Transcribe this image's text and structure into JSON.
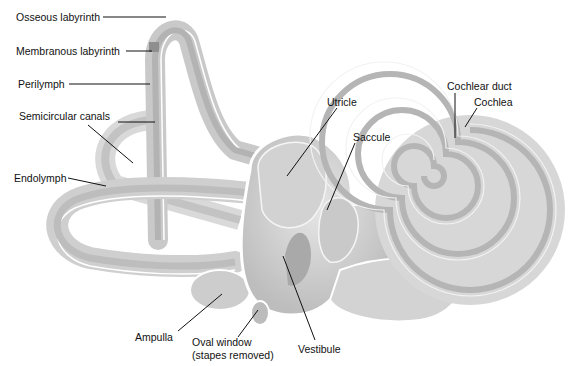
{
  "diagram": {
    "labels": [
      {
        "id": "osseous",
        "text": "Osseous labyrinth",
        "x": 16,
        "y": 12
      },
      {
        "id": "membranous",
        "text": "Membranous labyrinth",
        "x": 16,
        "y": 45
      },
      {
        "id": "perilymph",
        "text": "Perilymph",
        "x": 18,
        "y": 79
      },
      {
        "id": "semicircular",
        "text": "Semicircular canals",
        "x": 19,
        "y": 111
      },
      {
        "id": "endolymph",
        "text": "Endolymph",
        "x": 14,
        "y": 172
      },
      {
        "id": "utricle",
        "text": "Utricle",
        "x": 327,
        "y": 96
      },
      {
        "id": "saccule",
        "text": "Saccule",
        "x": 353,
        "y": 131
      },
      {
        "id": "cochlear_duct",
        "text": "Cochlear duct",
        "x": 447,
        "y": 80
      },
      {
        "id": "cochlea",
        "text": "Cochlea",
        "x": 474,
        "y": 96
      },
      {
        "id": "ampulla",
        "text": "Ampulla",
        "x": 135,
        "y": 331
      },
      {
        "id": "oval_window",
        "text": "Oval window",
        "x": 192,
        "y": 336
      },
      {
        "id": "oval_window_sub",
        "text": "(stapes removed)",
        "x": 192,
        "y": 349
      },
      {
        "id": "vestibule",
        "text": "Vestibule",
        "x": 298,
        "y": 343
      }
    ]
  }
}
